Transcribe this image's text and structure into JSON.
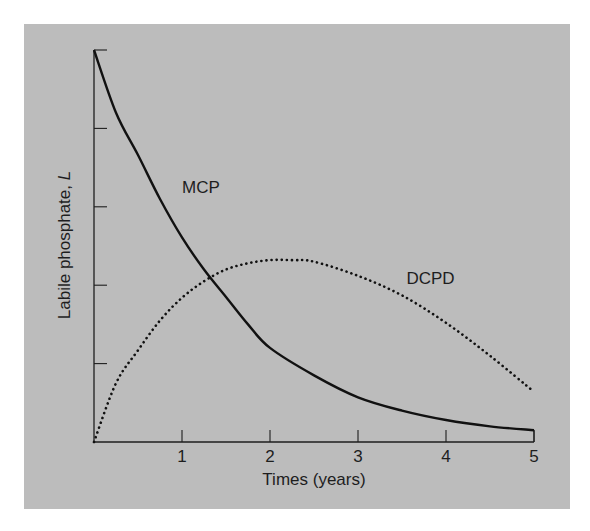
{
  "chart_data": {
    "type": "line",
    "title": "",
    "xlabel": "Times (years)",
    "ylabel": "Labile phosphate, L",
    "ylabel_parts": {
      "text": "Labile phosphate, ",
      "italic": "L"
    },
    "xlim": [
      0,
      5
    ],
    "ylim": [
      0,
      5
    ],
    "x_ticks": [
      1,
      2,
      3,
      4,
      5
    ],
    "x_tick_labels": [
      "1",
      "2",
      "3",
      "4",
      "5"
    ],
    "y_ticks": [
      1,
      2,
      3,
      4,
      5
    ],
    "y_tick_labels": [],
    "grid": false,
    "legend": "inline labels on curves",
    "series": [
      {
        "name": "MCP",
        "style": "solid",
        "color": "#111111",
        "x": [
          0,
          0.25,
          0.5,
          0.75,
          1,
          1.25,
          1.5,
          1.75,
          2,
          2.5,
          3,
          3.5,
          4,
          4.5,
          5
        ],
        "values": [
          5.0,
          4.2,
          3.66,
          3.1,
          2.61,
          2.2,
          1.85,
          1.5,
          1.2,
          0.85,
          0.57,
          0.4,
          0.28,
          0.2,
          0.15
        ]
      },
      {
        "name": "DCPD",
        "style": "dotted",
        "color": "#111111",
        "x": [
          0,
          0.25,
          0.5,
          0.75,
          1,
          1.25,
          1.5,
          1.75,
          2,
          2.25,
          2.5,
          3,
          3.5,
          4,
          4.5,
          5
        ],
        "values": [
          0,
          0.75,
          1.17,
          1.55,
          1.84,
          2.05,
          2.2,
          2.28,
          2.32,
          2.32,
          2.3,
          2.12,
          1.87,
          1.52,
          1.1,
          0.64
        ]
      }
    ],
    "annotations": [
      {
        "text": "MCP",
        "x": 1.0,
        "y": 3.25
      },
      {
        "text": "DCPD",
        "x": 3.55,
        "y": 2.09
      }
    ]
  },
  "colors": {
    "panel_background": "#bcbcbc",
    "page_background": "#ffffff",
    "ink": "#1e1e1e"
  }
}
